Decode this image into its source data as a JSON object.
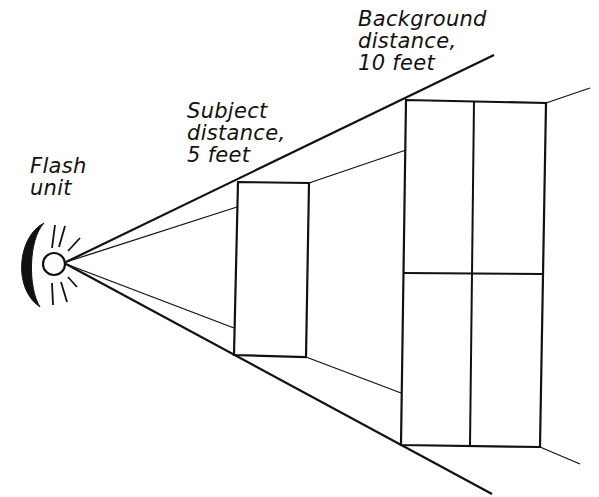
{
  "diagram": {
    "labels": {
      "flash": {
        "line1": "Flash",
        "line2": "unit"
      },
      "subject": {
        "line1": "Subject",
        "line2": "distance,",
        "line3": "5 feet"
      },
      "background": {
        "line1": "Background",
        "line2": "distance,",
        "line3": "10 feet"
      }
    },
    "colors": {
      "line": "#111111",
      "background": "#ffffff"
    }
  }
}
